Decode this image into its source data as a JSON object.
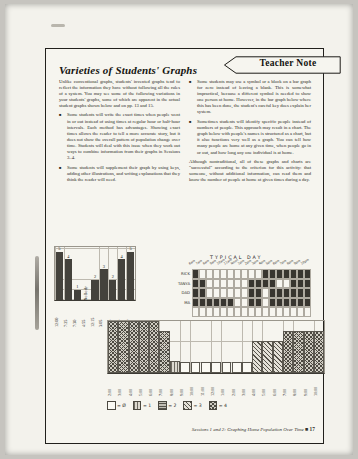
{
  "page": {
    "title": "Varieties of Students' Graphs",
    "teacher_note_label": "Teacher Note",
    "bullet_char": "■",
    "footer": {
      "text": "Sessions 1 and 2: Graphing Home Population Over Time",
      "separator": "■",
      "page_number": "17"
    }
  },
  "left_column": {
    "intro": "Unlike conventional graphs, students' invented graphs tend to reflect the information they have without following all the rules of a system. You may see some of the following variations in your students' graphs, some of which are apparent in the actual student graphs shown below and on pp. 13 and 15.",
    "bullets": [
      "Some students will write the exact times when people went in or out instead of using times at regular hour or half-hour intervals. Each method has advantages. Showing exact times allows the reader to tell a more accurate story, but it does not show the overall pattern of population change over time. Students will deal with this issue when they work out ways to combine information from their graphs in Sessions 3–4.",
      "Some students will supplement their graph by using keys, adding other illustrations, and writing explanations that they think the reader will need."
    ]
  },
  "right_column": {
    "bullets": [
      "Some students may use a symbol or a block on a bar graph for zero instead of leaving a blank. This is somewhat impractical, because a different symbol is needed to show one person at home. However, in the bar graph below where this has been done, the student's careful key does explain her system.",
      "Sometimes students will identify specific people instead of numbers of people. This approach may result in a chart. The graph below with people's names is structured as a chart, but it also functions very well as a graph. You can tell how many people are home at any given time, when people go in or out, and how long any one individual is at home."
    ],
    "closing": "Although nontraditional, all of these graphs and charts are \"successful\" according to the criterion for this activity: that someone, without additional information, can read them and know the number of people at home at given times during a day."
  },
  "chart_data": [
    {
      "type": "bar",
      "title": "",
      "categories": [
        "12:00",
        "7:25",
        "7:30",
        "4:55",
        "12:15",
        "3:05",
        "3:15",
        "5:25",
        "6:30"
      ],
      "values": [
        5,
        4,
        1,
        0,
        2,
        3,
        2,
        4,
        5
      ],
      "bar_labels": [
        "5",
        "4",
        "1",
        "NoBody",
        "2",
        "3",
        "2",
        "4",
        "5"
      ],
      "ylim": [
        0,
        5
      ],
      "grid": true,
      "bar_color": "#44423c",
      "description": "Hand-drawn student bar graph using exact in/out times; 'NoBody' written where zero people were home"
    },
    {
      "type": "heatmap",
      "title": "TYPICAL DAY",
      "columns": [
        "6am",
        "7am",
        "8am",
        "9am",
        "10am",
        "11am",
        "Noon",
        "1pm",
        "2pm",
        "3pm",
        "4pm",
        "5pm",
        "6pm",
        "7pm",
        "8pm",
        "9pm",
        "10pm"
      ],
      "rows": [
        {
          "name": "RICK",
          "cells": [
            1,
            0,
            0,
            0,
            0,
            0,
            0,
            0,
            0,
            0,
            1,
            1,
            1,
            1,
            1,
            1,
            1
          ]
        },
        {
          "name": "TANYA",
          "cells": [
            1,
            1,
            0,
            0,
            0,
            0,
            0,
            0,
            1,
            1,
            1,
            1,
            0,
            0,
            1,
            1,
            1
          ]
        },
        {
          "name": "DAD",
          "cells": [
            1,
            1,
            0,
            0,
            0,
            0,
            0,
            0,
            1,
            1,
            0,
            1,
            1,
            1,
            1,
            1,
            1
          ]
        },
        {
          "name": "MA",
          "cells": [
            1,
            1,
            1,
            1,
            1,
            1,
            0,
            0,
            1,
            1,
            0,
            1,
            1,
            1,
            1,
            1,
            1
          ]
        }
      ],
      "fill_color": "#383630",
      "description": "Student chart with people's names; filled cells show hours each person is at home"
    },
    {
      "type": "bar",
      "title": "",
      "categories": [
        "2:00",
        "3:00",
        "4:00",
        "5:00",
        "6:00",
        "7:00",
        "8:00",
        "9:00",
        "10:00",
        "11:00",
        "12:00",
        "1:00",
        "2:00",
        "3:00",
        "4:00",
        "5:00",
        "6:00",
        "7:00",
        "8:00",
        "9:00",
        "10:00"
      ],
      "values": [
        5,
        5,
        5,
        5,
        5,
        4,
        1,
        0,
        0,
        0,
        0,
        0,
        0,
        0,
        3,
        3,
        3,
        4,
        4,
        4,
        4
      ],
      "ylim": [
        0,
        5
      ],
      "grid": true,
      "legend": [
        {
          "symbol": "empty",
          "label": "= Ø"
        },
        {
          "symbol": "hatch-1",
          "label": "= 1"
        },
        {
          "symbol": "hatch-2",
          "label": "= 2"
        },
        {
          "symbol": "hatch-3",
          "label": "= 3"
        },
        {
          "symbol": "hatch-4",
          "label": "= 4"
        }
      ],
      "description": "Student bar graph with hatch-pattern key; a symbol block marks zero people at home"
    }
  ]
}
